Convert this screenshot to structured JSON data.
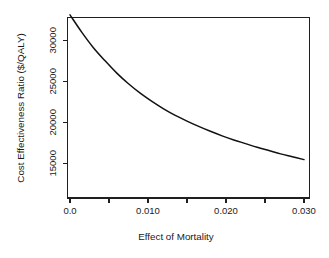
{
  "chart_data": {
    "type": "line",
    "title": "",
    "xlabel": "Effect of Mortality",
    "ylabel": "Cost Effectiveness Ratio ($/QALY)",
    "xlim": [
      0.0,
      0.0305
    ],
    "ylim": [
      13600,
      33400
    ],
    "grid": false,
    "legend": null,
    "x_ticks": [
      {
        "value": 0.0,
        "label": "0.0",
        "labeled": true
      },
      {
        "value": 0.005,
        "label": "",
        "labeled": false
      },
      {
        "value": 0.01,
        "label": "0.010",
        "labeled": true
      },
      {
        "value": 0.015,
        "label": "",
        "labeled": false
      },
      {
        "value": 0.02,
        "label": "0.020",
        "labeled": true
      },
      {
        "value": 0.025,
        "label": "",
        "labeled": false
      },
      {
        "value": 0.03,
        "label": "0.030",
        "labeled": true
      }
    ],
    "y_ticks": [
      {
        "value": 15000,
        "label": "15000",
        "labeled": true
      },
      {
        "value": 20000,
        "label": "20000",
        "labeled": true
      },
      {
        "value": 25000,
        "label": "25000",
        "labeled": true
      },
      {
        "value": 30000,
        "label": "30000",
        "labeled": true
      }
    ],
    "series": [
      {
        "name": "Cost Effectiveness Ratio",
        "color": "#111111",
        "x": [
          0.0,
          0.0015,
          0.003,
          0.0045,
          0.006,
          0.0075,
          0.009,
          0.0105,
          0.012,
          0.0135,
          0.015,
          0.0165,
          0.018,
          0.0195,
          0.021,
          0.0225,
          0.024,
          0.0255,
          0.027,
          0.0285,
          0.03
        ],
        "y": [
          33100,
          31000,
          29100,
          27500,
          26000,
          24700,
          23550,
          22550,
          21650,
          20850,
          20150,
          19500,
          18900,
          18350,
          17850,
          17400,
          16950,
          16550,
          16150,
          15800,
          15450
        ]
      }
    ]
  },
  "figure": {
    "background_color": "#ffffff",
    "axis_color": "#1f1f1f",
    "curve_color": "#111111"
  }
}
